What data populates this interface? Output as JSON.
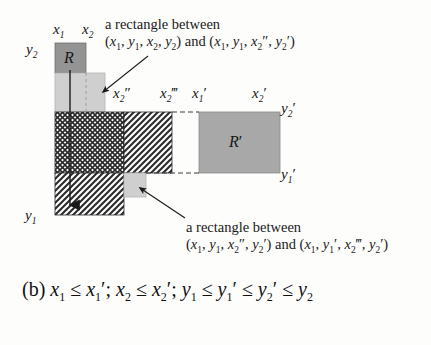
{
  "figure": {
    "label": "figure-2b-rectangle-decomposition",
    "annotations": {
      "top_note_line1": "a rectangle between",
      "top_note_line2_prefix": "(",
      "top_note_line2": "(x1, y1, x2, y2) and (x1, y1, x2'', y2')",
      "bottom_note_line1": "a rectangle between",
      "bottom_note_line2": "(x1, y1, x2'', y2') and (x1, y1', x2''', y2')"
    },
    "axis_labels": {
      "x1": "x",
      "x1_sub": "1",
      "x2": "x",
      "x2_sub": "2",
      "x2dd": "x",
      "x2dd_sub": "2",
      "x2dd_prime": "′′",
      "x2ddd": "x",
      "x2ddd_sub": "2",
      "x2ddd_prime": "′′′",
      "x1p": "x",
      "x1p_sub": "1",
      "x1p_prime": "′",
      "x2p": "x",
      "x2p_sub": "2",
      "x2p_prime": "′",
      "y1": "y",
      "y1_sub": "1",
      "y2": "y",
      "y2_sub": "2",
      "y1p": "y",
      "y1p_sub": "1",
      "y1p_prime": "′",
      "y2p": "y",
      "y2p_sub": "2",
      "y2p_prime": "′"
    },
    "region_labels": {
      "R": "R",
      "Rprime": "R",
      "Rprime_mark": "′"
    },
    "colors": {
      "dark_gray_fill": "#949494",
      "light_gray_fill": "#cccccc",
      "mid_gray_fill": "#a8a8a8",
      "hatch_ink": "#2b2b2b",
      "background": "#fdfdfc",
      "outline": "#3a3a3a"
    }
  },
  "caption": {
    "prefix": "(b) ",
    "text": "x1 ≤ x1′; x2 ≤ x2′; y1 ≤ y1′ ≤ y2′ ≤ y2",
    "label": "(b)",
    "le": "≤",
    "semi": ";"
  }
}
